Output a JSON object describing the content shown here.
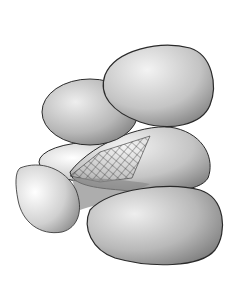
{
  "image": {
    "subject": "Illustration of a pile of smooth pebbles with a spider web between them",
    "width": 244,
    "height": 289,
    "background": "#ffffff",
    "stroke_color": "#2a2a2a",
    "stone_light": "#f2f2f2",
    "stone_dark": "#8a8a8a",
    "stones": [
      "top-right-stone",
      "upper-left-stone",
      "middle-right-stone",
      "middle-back-stone",
      "front-left-stone",
      "bottom-right-stone"
    ],
    "elements": [
      "spider-web"
    ]
  }
}
